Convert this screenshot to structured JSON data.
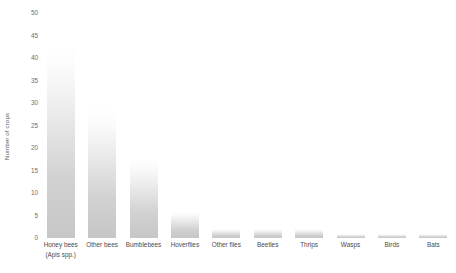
{
  "chart_data": {
    "type": "bar",
    "title": "",
    "xlabel": "",
    "ylabel": "Number of crops",
    "ylim": [
      0,
      50
    ],
    "yticks": [
      0,
      5,
      10,
      15,
      20,
      25,
      30,
      35,
      40,
      45,
      50
    ],
    "grid": false,
    "legend": null,
    "bar_color": "#c8c8c8",
    "categories": [
      "Honey bees",
      "Other bees",
      "Bumblebees",
      "Hoverflies",
      "Other flies",
      "Beetles",
      "Thrips",
      "Wasps",
      "Birds",
      "Bats"
    ],
    "category_sublabels": [
      "(Apis spp.)",
      "",
      "",
      "",
      "",
      "",
      "",
      "",
      "",
      ""
    ],
    "values": [
      43,
      29,
      18,
      6,
      2,
      2,
      2,
      1,
      1,
      1
    ]
  }
}
